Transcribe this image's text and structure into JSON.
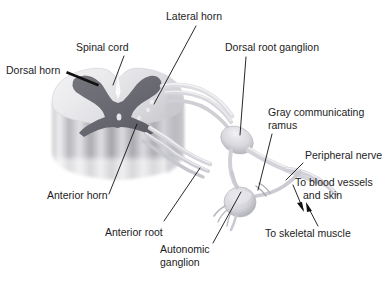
{
  "figure": {
    "background_color": "#ffffff",
    "line_color": "#111111",
    "text_color": "#1c1c1c",
    "gray_matter_color": "#6d6d76",
    "white_matter_color": "#e9e9ec",
    "nerve_color": "#d2d2d6",
    "cord_body_color": "#b8b8bc"
  },
  "labels": {
    "lateral_horn": "Lateral horn",
    "spinal_cord": "Spinal cord",
    "dorsal_horn": "Dorsal horn",
    "dorsal_root_ganglion": "Dorsal root ganglion",
    "gray_communicating_ramus_line1": "Gray communicating",
    "gray_communicating_ramus_line2": "ramus",
    "peripheral_nerve": "Peripheral nerve",
    "to_blood_vessels_line1": "To blood vessels",
    "to_blood_vessels_line2": "and skin",
    "anterior_horn": "Anterior horn",
    "anterior_root": "Anterior root",
    "autonomic_ganglion_line1": "Autonomic",
    "autonomic_ganglion_line2": "ganglion",
    "to_skeletal_muscle": "To skeletal muscle"
  }
}
